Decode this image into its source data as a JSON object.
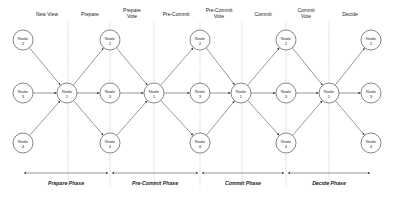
{
  "diagram": {
    "title": "",
    "stages": [
      {
        "label": "New View",
        "x": 47
      },
      {
        "label": "Prepare",
        "x": 90
      },
      {
        "label": "Prepare Vote",
        "line1": "Prepare",
        "line2": "Vote",
        "x": 132
      },
      {
        "label": "Pre-Commit",
        "x": 176
      },
      {
        "label": "Pre-Commit Vote",
        "line1": "Pre-Commit",
        "line2": "Vote",
        "x": 219
      },
      {
        "label": "Commit",
        "x": 263
      },
      {
        "label": "Commit Vote",
        "line1": "Commit",
        "line2": "Vote",
        "x": 306
      },
      {
        "label": "Decide",
        "x": 350
      }
    ],
    "dividers_x": [
      68,
      110,
      154,
      200,
      242,
      286,
      329
    ],
    "nodes": [
      {
        "id": "n2a",
        "line1": "Node",
        "line2": "2",
        "x": 23,
        "y": 40
      },
      {
        "id": "n3a",
        "line1": "Node",
        "line2": "3",
        "x": 23,
        "y": 93
      },
      {
        "id": "n4a",
        "line1": "Node",
        "line2": "4",
        "x": 23,
        "y": 143
      },
      {
        "id": "n1a",
        "line1": "Node",
        "line2": "1",
        "x": 67,
        "y": 93
      },
      {
        "id": "n2b",
        "line1": "Node",
        "line2": "2",
        "x": 110,
        "y": 40
      },
      {
        "id": "n3b",
        "line1": "Node",
        "line2": "3",
        "x": 110,
        "y": 93
      },
      {
        "id": "n4b",
        "line1": "Node",
        "line2": "4",
        "x": 110,
        "y": 143
      },
      {
        "id": "n1b",
        "line1": "Node",
        "line2": "1",
        "x": 154,
        "y": 93
      },
      {
        "id": "n2c",
        "line1": "Node",
        "line2": "2",
        "x": 200,
        "y": 40
      },
      {
        "id": "n3c",
        "line1": "Node",
        "line2": "3",
        "x": 200,
        "y": 93
      },
      {
        "id": "n4c",
        "line1": "Node",
        "line2": "4",
        "x": 200,
        "y": 143
      },
      {
        "id": "n1c",
        "line1": "Node",
        "line2": "1",
        "x": 241,
        "y": 93
      },
      {
        "id": "n2d",
        "line1": "Node",
        "line2": "2",
        "x": 286,
        "y": 40
      },
      {
        "id": "n3d",
        "line1": "Node",
        "line2": "3",
        "x": 286,
        "y": 93
      },
      {
        "id": "n4d",
        "line1": "Node",
        "line2": "4",
        "x": 286,
        "y": 143
      },
      {
        "id": "n1d",
        "line1": "Node",
        "line2": "1",
        "x": 329,
        "y": 93
      },
      {
        "id": "n2e",
        "line1": "Node",
        "line2": "2",
        "x": 371,
        "y": 40
      },
      {
        "id": "n3e",
        "line1": "Node",
        "line2": "3",
        "x": 371,
        "y": 93
      },
      {
        "id": "n4e",
        "line1": "Node",
        "line2": "4",
        "x": 371,
        "y": 143
      }
    ],
    "edges": [
      [
        "n2a",
        "n1a"
      ],
      [
        "n3a",
        "n1a"
      ],
      [
        "n4a",
        "n1a"
      ],
      [
        "n1a",
        "n2b"
      ],
      [
        "n1a",
        "n3b"
      ],
      [
        "n1a",
        "n4b"
      ],
      [
        "n2b",
        "n1b"
      ],
      [
        "n3b",
        "n1b"
      ],
      [
        "n4b",
        "n1b"
      ],
      [
        "n1b",
        "n2c"
      ],
      [
        "n1b",
        "n3c"
      ],
      [
        "n1b",
        "n4c"
      ],
      [
        "n2c",
        "n1c"
      ],
      [
        "n3c",
        "n1c"
      ],
      [
        "n4c",
        "n1c"
      ],
      [
        "n1c",
        "n2d"
      ],
      [
        "n1c",
        "n3d"
      ],
      [
        "n1c",
        "n4d"
      ],
      [
        "n2d",
        "n1d"
      ],
      [
        "n3d",
        "n1d"
      ],
      [
        "n4d",
        "n1d"
      ],
      [
        "n1d",
        "n2e"
      ],
      [
        "n1d",
        "n3e"
      ],
      [
        "n1d",
        "n4e"
      ]
    ],
    "phases": [
      {
        "label": "Prepare Phase",
        "x1": 24,
        "x2": 108
      },
      {
        "label": "Pre-Commit Phase",
        "x1": 112,
        "x2": 198
      },
      {
        "label": "Commit Phase",
        "x1": 202,
        "x2": 284
      },
      {
        "label": "Decide Phase",
        "x1": 288,
        "x2": 370
      }
    ]
  },
  "colors": {
    "stroke": "#555555",
    "divider": "#999999",
    "text": "#222222",
    "background": "#ffffff"
  }
}
